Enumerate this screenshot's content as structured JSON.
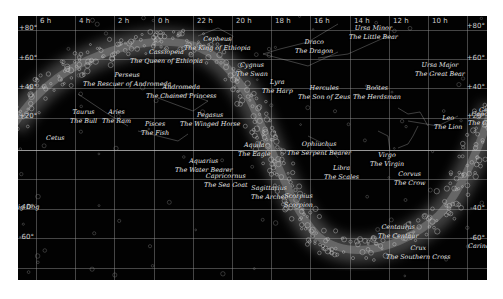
{
  "map": {
    "type": "star chart",
    "background": "#020202",
    "hour_labels": [
      {
        "label": "6 h",
        "x": 22
      },
      {
        "label": "4 h",
        "x": 61
      },
      {
        "label": "2 h",
        "x": 100
      },
      {
        "label": "0 h",
        "x": 140
      },
      {
        "label": "22 h",
        "x": 179
      },
      {
        "label": "20 h",
        "x": 218
      },
      {
        "label": "18 h",
        "x": 257
      },
      {
        "label": "16 h",
        "x": 296
      },
      {
        "label": "14 h",
        "x": 336
      },
      {
        "label": "12 h",
        "x": 375
      },
      {
        "label": "10 h",
        "x": 414
      }
    ],
    "dec_labels_left": [
      {
        "label": "+80°",
        "y": 8
      },
      {
        "label": "+60°",
        "y": 38
      },
      {
        "label": "+40°",
        "y": 67
      },
      {
        "label": "+20°",
        "y": 96
      },
      {
        "label": "-40°",
        "y": 187
      },
      {
        "label": "-60°",
        "y": 217
      }
    ],
    "dec_labels_right": [
      {
        "label": "+80°",
        "y": 6
      },
      {
        "label": "+60°",
        "y": 38
      },
      {
        "label": "+40°",
        "y": 67
      },
      {
        "label": "+20°",
        "y": 96
      },
      {
        "label": "-40°",
        "y": 188
      },
      {
        "label": "-60°",
        "y": 218
      }
    ],
    "constellations": [
      {
        "name": "Cepheus",
        "subtitle": "The King of Ethiopia",
        "x": 166,
        "y": 19
      },
      {
        "name": "Cassiopeia",
        "subtitle": "The Queen of Ethiopia",
        "x": 112,
        "y": 32
      },
      {
        "name": "Draco",
        "subtitle": "The Dragon",
        "x": 277,
        "y": 22
      },
      {
        "name": "Ursa Minor",
        "subtitle": "The Little Bear",
        "x": 331,
        "y": 8
      },
      {
        "name": "Ursa Major",
        "subtitle": "The Great Bear",
        "x": 397,
        "y": 45
      },
      {
        "name": "Perseus",
        "subtitle": "The Rescuer of Andromeda",
        "x": 65,
        "y": 55
      },
      {
        "name": "Andromeda",
        "subtitle": "The Chained Princess",
        "x": 128,
        "y": 67
      },
      {
        "name": "Cygnus",
        "subtitle": "The Swan",
        "x": 218,
        "y": 45
      },
      {
        "name": "Lyra",
        "subtitle": "The Harp",
        "x": 244,
        "y": 62
      },
      {
        "name": "Hercules",
        "subtitle": "The Son of Zeus",
        "x": 280,
        "y": 68
      },
      {
        "name": "Boötes",
        "subtitle": "The Herdsman",
        "x": 335,
        "y": 68
      },
      {
        "name": "Cancer",
        "subtitle": "The Crab",
        "x": 450,
        "y": 94
      },
      {
        "name": "Leo",
        "subtitle": "The Lion",
        "x": 416,
        "y": 98
      },
      {
        "name": "Taurus",
        "subtitle": "The Bull",
        "x": 52,
        "y": 92
      },
      {
        "name": "Aries",
        "subtitle": "The Ram",
        "x": 84,
        "y": 92
      },
      {
        "name": "Pisces",
        "subtitle": "The Fish",
        "x": 123,
        "y": 104
      },
      {
        "name": "Pegasus",
        "subtitle": "The Winged Horse",
        "x": 162,
        "y": 95
      },
      {
        "name": "Cetus",
        "subtitle": "",
        "x": 28,
        "y": 118
      },
      {
        "name": "Aquila",
        "subtitle": "The Eagle",
        "x": 220,
        "y": 125
      },
      {
        "name": "Ophiuchus",
        "subtitle": "The Serpent Bearer",
        "x": 269,
        "y": 124
      },
      {
        "name": "Virgo",
        "subtitle": "The Virgin",
        "x": 352,
        "y": 135
      },
      {
        "name": "Aquarius",
        "subtitle": "The Water Bearer",
        "x": 157,
        "y": 141
      },
      {
        "name": "Capricornus",
        "subtitle": "The Sea Goat",
        "x": 186,
        "y": 156
      },
      {
        "name": "Libra",
        "subtitle": "The Scales",
        "x": 306,
        "y": 148
      },
      {
        "name": "Corvus",
        "subtitle": "The Crow",
        "x": 376,
        "y": 154
      },
      {
        "name": "Sagittarius",
        "subtitle": "The Archer",
        "x": 233,
        "y": 168
      },
      {
        "name": "Scorpius",
        "subtitle": "Scorpion",
        "x": 266,
        "y": 176
      },
      {
        "name": "Canis Major",
        "subtitle": "ig Dog",
        "x": 0,
        "y": 187,
        "partial": true
      },
      {
        "name": "Centaurus",
        "subtitle": "The Centaur",
        "x": 360,
        "y": 207
      },
      {
        "name": "Crux",
        "subtitle": "The Southern Cross",
        "x": 368,
        "y": 228
      },
      {
        "name": "Carina",
        "subtitle": "",
        "x": 450,
        "y": 226
      },
      {
        "name": "Gemini",
        "subtitle": "",
        "x": 461,
        "y": 90,
        "partial": true
      }
    ]
  }
}
